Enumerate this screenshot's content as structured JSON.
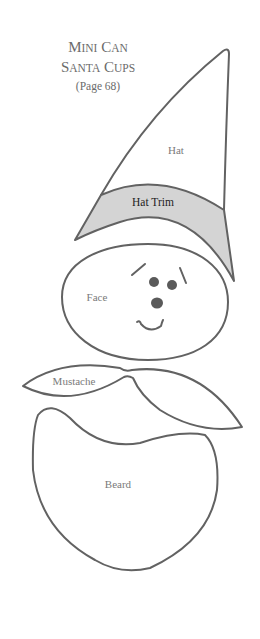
{
  "title": {
    "line1_initial": "M",
    "line1_rest": "INI",
    "line1b_initial": "C",
    "line1b_rest": "AN",
    "line2_initial": "S",
    "line2_rest": "ANTA",
    "line2b_initial": "C",
    "line2b_rest": "UPS",
    "page_ref": "(Page 68)"
  },
  "pattern_pieces": {
    "hat": "Hat",
    "hat_trim": "Hat Trim",
    "face": "Face",
    "mustache": "Mustache",
    "beard": "Beard"
  },
  "colors": {
    "outline": "#626262",
    "trim_fill": "#d4d4d4",
    "text": "#7a7a7a"
  }
}
